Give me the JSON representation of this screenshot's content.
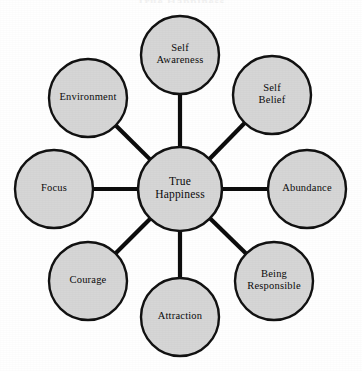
{
  "page": {
    "cropped_header_text": "True Happiness",
    "background_color": "#ffffff"
  },
  "chart_data": {
    "type": "diagram",
    "diagram_kind": "hub-and-spoke",
    "title": "True Happiness",
    "center": {
      "label": "True Happiness",
      "line1": "True",
      "line2": "Happiness",
      "cx": 180,
      "cy": 189,
      "r": 42
    },
    "style": {
      "node_fill": "#d6d6d6",
      "node_stroke": "#121212",
      "spoke_color": "#0d0d0d",
      "text_color": "#0b0b0b"
    },
    "layout": {
      "orbit_radius": 135,
      "node_radius": 39,
      "node_count": 8
    },
    "nodes": [
      {
        "id": "self-awareness",
        "label": "Self Awareness",
        "line1": "Self",
        "line2": "Awareness",
        "position": "top",
        "angle_deg": 270,
        "cx": 180,
        "cy": 55,
        "r": 39
      },
      {
        "id": "self-belief",
        "label": "Self Belief",
        "line1": "Self",
        "line2": "Belief",
        "position": "top-right",
        "angle_deg": 315,
        "cx": 272,
        "cy": 95,
        "r": 39
      },
      {
        "id": "abundance",
        "label": "Abundance",
        "line1": "Abundance",
        "line2": "",
        "position": "right",
        "angle_deg": 0,
        "cx": 307,
        "cy": 189,
        "r": 39
      },
      {
        "id": "being-responsible",
        "label": "Being Responsible",
        "line1": "Being",
        "line2": "Responsible",
        "position": "bottom-right",
        "angle_deg": 45,
        "cx": 274,
        "cy": 281,
        "r": 39
      },
      {
        "id": "attraction",
        "label": "Attraction",
        "line1": "Attraction",
        "line2": "",
        "position": "bottom",
        "angle_deg": 90,
        "cx": 180,
        "cy": 317,
        "r": 39
      },
      {
        "id": "courage",
        "label": "Courage",
        "line1": "Courage",
        "line2": "",
        "position": "bottom-left",
        "angle_deg": 135,
        "cx": 88,
        "cy": 281,
        "r": 39
      },
      {
        "id": "focus",
        "label": "Focus",
        "line1": "Focus",
        "line2": "",
        "position": "left",
        "angle_deg": 180,
        "cx": 54,
        "cy": 189,
        "r": 39
      },
      {
        "id": "environment",
        "label": "Environment",
        "line1": "Environment",
        "line2": "",
        "position": "top-left",
        "angle_deg": 225,
        "cx": 88,
        "cy": 98,
        "r": 39
      }
    ],
    "edges": [
      {
        "from": "True Happiness",
        "to": "Self Awareness"
      },
      {
        "from": "True Happiness",
        "to": "Self Belief"
      },
      {
        "from": "True Happiness",
        "to": "Abundance"
      },
      {
        "from": "True Happiness",
        "to": "Being Responsible"
      },
      {
        "from": "True Happiness",
        "to": "Attraction"
      },
      {
        "from": "True Happiness",
        "to": "Courage"
      },
      {
        "from": "True Happiness",
        "to": "Focus"
      },
      {
        "from": "True Happiness",
        "to": "Environment"
      }
    ]
  }
}
